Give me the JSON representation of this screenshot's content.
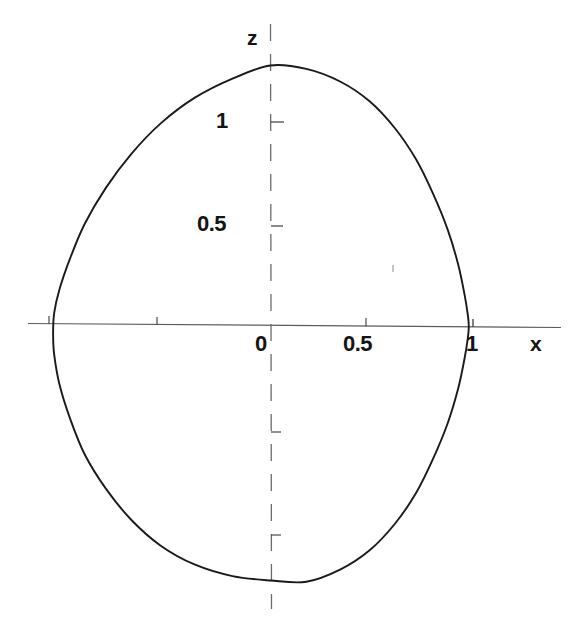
{
  "figure": {
    "kind": "line-contour-plot",
    "background_color": "#ffffff",
    "curve_color": "#1a1a1a",
    "axis_color": "#555555",
    "label_color": "#141414"
  },
  "axes": {
    "x_axis_name": "x",
    "z_axis_name": "z",
    "x_ticks_labeled": [
      "0",
      "0.5",
      "1"
    ],
    "z_ticks_labeled": [
      "0.5",
      "1"
    ],
    "x_label_0": "0",
    "x_label_05": "0.5",
    "x_label_1": "1",
    "z_label_05": "0.5",
    "z_label_1": "1"
  },
  "chart_data": {
    "type": "line",
    "title": "",
    "subtitle": "",
    "xlabel": "x",
    "ylabel": "z",
    "xlim": [
      -1.12,
      1.42
    ],
    "ylim": [
      -1.43,
      1.45
    ],
    "grid": false,
    "legend": null,
    "legend_position": "none",
    "x_ticks": [
      -0.5,
      0,
      0.5,
      1
    ],
    "x_tick_labels": [
      "",
      "0",
      "0.5",
      "1"
    ],
    "y_ticks": [
      -1,
      -0.5,
      0.5,
      1
    ],
    "y_tick_labels": [
      "",
      "",
      "0.5",
      "1"
    ],
    "annotations": [],
    "series": [
      {
        "name": "closed contour",
        "closed": true,
        "extrema": {
          "top": [
            0.04,
            1.26
          ],
          "bottom": [
            0.04,
            -1.24
          ],
          "left": [
            -0.99,
            0.0
          ],
          "right": [
            0.98,
            0.0
          ]
        },
        "x": [
          0.04,
          0.21,
          0.37,
          0.51,
          0.63,
          0.73,
          0.81,
          0.88,
          0.93,
          0.96,
          0.975,
          0.98,
          0.975,
          0.96,
          0.93,
          0.88,
          0.81,
          0.73,
          0.63,
          0.51,
          0.37,
          0.21,
          0.04,
          -0.14,
          -0.32,
          -0.48,
          -0.62,
          -0.74,
          -0.84,
          -0.91,
          -0.96,
          -0.985,
          -0.99,
          -0.985,
          -0.96,
          -0.91,
          -0.84,
          -0.74,
          -0.62,
          -0.48,
          -0.32,
          -0.14,
          0.04
        ],
        "z": [
          1.26,
          1.245,
          1.185,
          1.09,
          0.96,
          0.81,
          0.645,
          0.47,
          0.3,
          0.155,
          0.06,
          0.0,
          -0.06,
          -0.155,
          -0.3,
          -0.47,
          -0.645,
          -0.81,
          -0.96,
          -1.09,
          -1.185,
          -1.245,
          -1.24,
          -1.22,
          -1.165,
          -1.075,
          -0.95,
          -0.8,
          -0.635,
          -0.46,
          -0.295,
          -0.15,
          -0.05,
          0.05,
          0.165,
          0.315,
          0.485,
          0.66,
          0.825,
          0.975,
          1.1,
          1.195,
          1.26
        ]
      }
    ]
  }
}
